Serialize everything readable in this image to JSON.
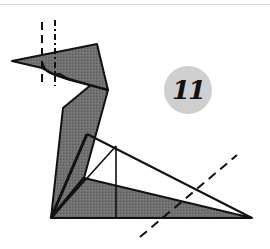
{
  "diagram": {
    "step_number": "11",
    "colors": {
      "paper_fill": "#6e6e6e",
      "edge": "#111111",
      "badge_fill": "#cfcfcf",
      "background": "#ffffff"
    },
    "fold_lines": [
      {
        "name": "valley-fold-vertical",
        "style": "dashed"
      },
      {
        "name": "mountain-fold-vertical",
        "style": "dotted"
      },
      {
        "name": "valley-fold-diagonal",
        "style": "dashed"
      }
    ]
  }
}
